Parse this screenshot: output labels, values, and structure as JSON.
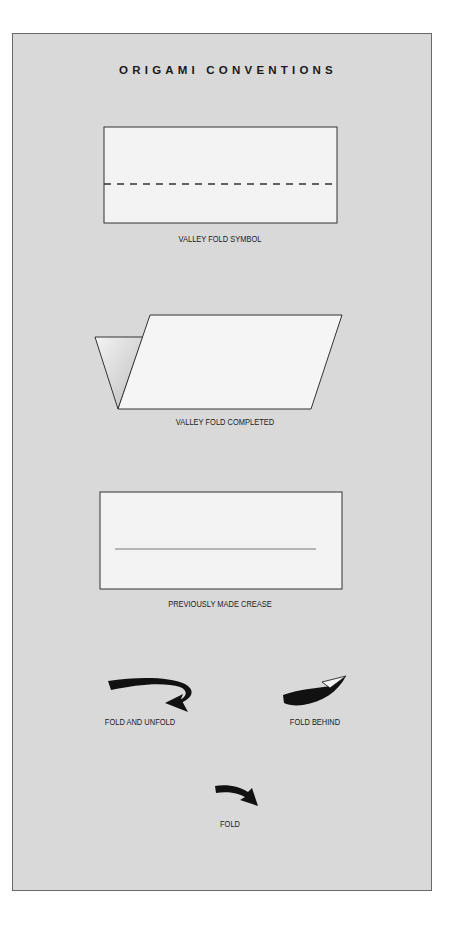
{
  "title": "ORIGAMI CONVENTIONS",
  "colors": {
    "background": "#ffffff",
    "panel": "#d9d9d9",
    "panel_border": "#6a6a6a",
    "paper": "#f3f3f3",
    "ink": "#1a1a1a"
  },
  "symbols": [
    {
      "id": "valley-fold-symbol",
      "caption": "VALLEY FOLD SYMBOL",
      "line_style": "dashed"
    },
    {
      "id": "valley-fold-completed",
      "caption": "VALLEY FOLD COMPLETED"
    },
    {
      "id": "previously-made-crease",
      "caption": "PREVIOUSLY MADE CREASE",
      "line_style": "solid-thin"
    },
    {
      "id": "fold-and-unfold",
      "caption": "FOLD AND UNFOLD",
      "icon": "fold-and-unfold-arrow"
    },
    {
      "id": "fold-behind",
      "caption": "FOLD BEHIND",
      "icon": "fold-behind-arrow"
    },
    {
      "id": "fold",
      "caption": "FOLD",
      "icon": "fold-arrow"
    }
  ]
}
